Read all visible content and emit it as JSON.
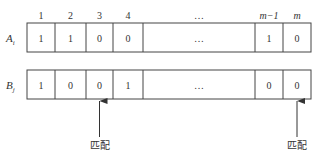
{
  "column_headers": [
    "1",
    "2",
    "3",
    "4",
    "…",
    "m−1",
    "m"
  ],
  "rows": [
    {
      "label": "A",
      "subscript": "i",
      "cells": [
        "1",
        "1",
        "0",
        "0",
        "…",
        "1",
        "0"
      ]
    },
    {
      "label": "B",
      "subscript": "j",
      "cells": [
        "1",
        "0",
        "0",
        "1",
        "…",
        "0",
        "0"
      ]
    }
  ],
  "annotations": [
    {
      "label": "匹配",
      "column_index": 2
    },
    {
      "label": "匹配",
      "column_index": 6
    }
  ]
}
